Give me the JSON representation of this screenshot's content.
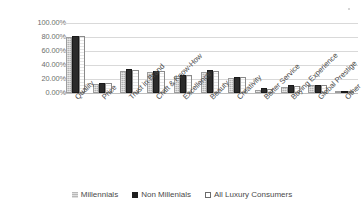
{
  "chart_data": {
    "type": "bar",
    "title": "",
    "xlabel": "",
    "ylabel": "",
    "ylim": [
      0,
      100
    ],
    "grid": true,
    "legend_position": "bottom",
    "unit": "percent",
    "categories": [
      "Quality",
      "Price",
      "Trust in Brand",
      "Craft & Know-How",
      "Excellence",
      "Beauty",
      "Creativity",
      "Better Service",
      "Buying Experience",
      "Global Prestige",
      "Other"
    ],
    "ytick_labels": [
      "100.00%",
      "80.00%",
      "60.00%",
      "40.00%",
      "20.00%",
      "0.00%"
    ],
    "ytick_values": [
      100,
      80,
      60,
      40,
      20,
      0
    ],
    "series": [
      {
        "name": "Millennials",
        "color": "#b3b3b3",
        "values": [
          80,
          13,
          31,
          30,
          25,
          30,
          22,
          5,
          9,
          11,
          1
        ]
      },
      {
        "name": "Non Millenials",
        "color": "#2b2b2b",
        "values": [
          81,
          15,
          34,
          31,
          26,
          33,
          23,
          7,
          11,
          12,
          2
        ]
      },
      {
        "name": "All Luxury Consumers",
        "color": "#ffffff",
        "values": [
          82,
          14,
          33,
          31,
          26,
          32,
          23,
          6,
          10,
          12,
          2
        ]
      }
    ]
  },
  "legend": {
    "items": [
      {
        "label": "Millennials"
      },
      {
        "label": "Non Millenials"
      },
      {
        "label": "All Luxury Consumers"
      }
    ]
  }
}
